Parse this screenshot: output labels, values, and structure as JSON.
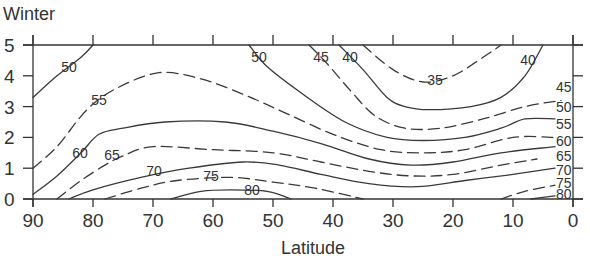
{
  "chart_data": {
    "type": "contour",
    "title": "Winter",
    "xlabel": "Latitude",
    "ylabel": "",
    "xlim": [
      90,
      0
    ],
    "ylim": [
      0,
      5
    ],
    "x_ticks": [
      90,
      80,
      70,
      60,
      50,
      40,
      30,
      20,
      10,
      0
    ],
    "y_ticks": [
      0,
      1,
      2,
      3,
      4,
      5
    ],
    "grid": false,
    "legend": null,
    "contour_interval": 5,
    "contours": [
      {
        "level": 35,
        "style": "dashed",
        "points": [
          [
            35,
            5
          ],
          [
            30,
            4.2
          ],
          [
            25,
            3.8
          ],
          [
            20,
            4.0
          ],
          [
            15,
            4.6
          ],
          [
            12,
            5
          ]
        ],
        "label_pos": [
          25.5,
          3.8
        ]
      },
      {
        "level": 40,
        "style": "solid",
        "points": [
          [
            39,
            5
          ],
          [
            35,
            4.2
          ],
          [
            31,
            3.3
          ],
          [
            28,
            3.0
          ],
          [
            24,
            2.9
          ],
          [
            17,
            3.0
          ],
          [
            12,
            3.3
          ],
          [
            8,
            4
          ],
          [
            5,
            5
          ]
        ],
        "label_pos": [
          8,
          4.2
        ]
      },
      {
        "level": 45,
        "style": "dashed",
        "points": [
          [
            44,
            5
          ],
          [
            41,
            4.4
          ],
          [
            37,
            3.5
          ],
          [
            33,
            2.7
          ],
          [
            28,
            2.3
          ],
          [
            22,
            2.3
          ],
          [
            15,
            2.6
          ],
          [
            8,
            3.0
          ],
          [
            2,
            3.2
          ]
        ],
        "label_pos": [
          1,
          3.2
        ]
      },
      {
        "level": 50,
        "style": "solid",
        "points": [
          [
            90,
            3.3
          ],
          [
            86,
            4.0
          ],
          [
            82,
            4.6
          ],
          [
            80,
            5
          ]
        ],
        "label_pos": [
          86,
          4.2
        ]
      },
      {
        "level": 50,
        "style": "solid",
        "points": [
          [
            54,
            5
          ],
          [
            51,
            4.3
          ],
          [
            45,
            3.4
          ],
          [
            38,
            2.5
          ],
          [
            31,
            2.0
          ],
          [
            25,
            1.9
          ],
          [
            18,
            2.0
          ],
          [
            12,
            2.3
          ],
          [
            8,
            2.6
          ],
          [
            3,
            2.6
          ]
        ],
        "label_pos": [
          52,
          4.7
        ]
      },
      {
        "level": 55,
        "style": "dashed",
        "points": [
          [
            90,
            1.0
          ],
          [
            86,
            1.7
          ],
          [
            81,
            2.9
          ],
          [
            76,
            3.6
          ],
          [
            69,
            4.1
          ],
          [
            62,
            3.9
          ],
          [
            55,
            3.4
          ],
          [
            48,
            2.8
          ],
          [
            40,
            2.1
          ],
          [
            32,
            1.6
          ],
          [
            25,
            1.5
          ],
          [
            18,
            1.6
          ],
          [
            10,
            2.0
          ],
          [
            3,
            2.0
          ]
        ],
        "label_pos": [
          82,
          3.2
        ]
      },
      {
        "level": 60,
        "style": "solid",
        "points": [
          [
            90,
            0.15
          ],
          [
            86,
            0.75
          ],
          [
            82,
            1.5
          ],
          [
            79,
            2.1
          ],
          [
            75,
            2.3
          ],
          [
            68,
            2.5
          ],
          [
            58,
            2.5
          ],
          [
            50,
            2.2
          ],
          [
            42,
            1.8
          ],
          [
            34,
            1.3
          ],
          [
            27,
            1.1
          ],
          [
            20,
            1.2
          ],
          [
            12,
            1.5
          ],
          [
            3,
            1.7
          ]
        ],
        "label_pos": [
          80,
          1.6
        ]
      },
      {
        "level": 65,
        "style": "dashed",
        "points": [
          [
            86,
            0
          ],
          [
            82,
            0.6
          ],
          [
            78,
            1.1
          ],
          [
            75,
            1.4
          ],
          [
            70,
            1.7
          ],
          [
            60,
            1.6
          ],
          [
            50,
            1.5
          ],
          [
            42,
            1.2
          ],
          [
            34,
            0.9
          ],
          [
            27,
            0.75
          ],
          [
            20,
            0.8
          ],
          [
            12,
            1.1
          ],
          [
            6,
            1.3
          ]
        ],
        "label_pos": [
          75,
          1.3
        ]
      },
      {
        "level": 70,
        "style": "solid",
        "points": [
          [
            84,
            0
          ],
          [
            80,
            0.3
          ],
          [
            72,
            0.7
          ],
          [
            64,
            1.0
          ],
          [
            55,
            1.2
          ],
          [
            49,
            1.1
          ],
          [
            42,
            0.8
          ],
          [
            34,
            0.5
          ],
          [
            26,
            0.4
          ],
          [
            18,
            0.6
          ],
          [
            10,
            0.8
          ],
          [
            3,
            1.0
          ]
        ],
        "label_pos": [
          68,
          0.85
        ]
      },
      {
        "level": 75,
        "style": "dashed",
        "points": [
          [
            78,
            0
          ],
          [
            72,
            0.35
          ],
          [
            66,
            0.6
          ],
          [
            57,
            0.7
          ],
          [
            50,
            0.55
          ],
          [
            43,
            0.35
          ],
          [
            35,
            0
          ]
        ],
        "label_pos": [
          59,
          0.7
        ]
      },
      {
        "level": 75,
        "style": "dashed",
        "points": [
          [
            12,
            0
          ],
          [
            8,
            0.25
          ],
          [
            3,
            0.45
          ]
        ],
        "label_pos": [
          1,
          0.4
        ]
      },
      {
        "level": 80,
        "style": "solid",
        "points": [
          [
            67,
            0
          ],
          [
            62,
            0.25
          ],
          [
            57,
            0.3
          ],
          [
            51,
            0.25
          ],
          [
            47,
            0
          ]
        ],
        "label_pos": [
          53,
          0.25
        ]
      },
      {
        "level": 80,
        "style": "solid",
        "points": [
          [
            7,
            0
          ],
          [
            3,
            0.1
          ]
        ],
        "label_pos": [
          1,
          0.05
        ]
      }
    ],
    "right_edge_labels": [
      {
        "text": "45",
        "y": 3.65
      },
      {
        "text": "50",
        "y": 3.0
      },
      {
        "text": "55",
        "y": 2.45
      },
      {
        "text": "60",
        "y": 1.9
      },
      {
        "text": "65",
        "y": 1.4
      },
      {
        "text": "70",
        "y": 0.95
      },
      {
        "text": "75",
        "y": 0.5
      },
      {
        "text": "80",
        "y": 0.1
      }
    ]
  },
  "labels": {
    "title": "Winter",
    "xlabel": "Latitude",
    "x_ticks": [
      "90",
      "80",
      "70",
      "60",
      "50",
      "40",
      "30",
      "20",
      "10",
      "0"
    ],
    "y_ticks": [
      "0",
      "1",
      "2",
      "3",
      "4",
      "5"
    ],
    "contour_labels": {
      "c50_left": "50",
      "c55": "55",
      "c60": "60",
      "c65": "65",
      "c70": "70",
      "c75": "75",
      "c80": "80",
      "c50_top": "50",
      "c45_top": "45",
      "c40_top": "40",
      "c35": "35",
      "c40_right": "40",
      "r45": "45",
      "r50": "50",
      "r55": "55",
      "r60": "60",
      "r65": "65",
      "r70": "70",
      "r75": "75",
      "r80": "80"
    }
  }
}
